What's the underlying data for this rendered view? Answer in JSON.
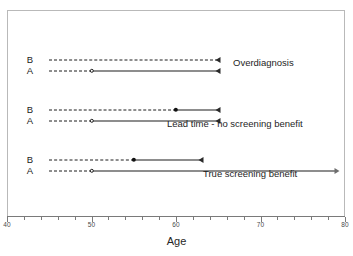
{
  "chart_data": {
    "type": "line",
    "title": "",
    "subtitle": "",
    "xlabel": "Age",
    "ylabel": "",
    "xlim": [
      40,
      80
    ],
    "grid": false,
    "legend": "none",
    "x_ticks_major": [
      40,
      50,
      60,
      70,
      80
    ],
    "x_tick_labels": [
      "40",
      "50",
      "60",
      "70",
      "80"
    ],
    "x_minor_tick_step": 2,
    "row_labels": [
      "B",
      "A"
    ],
    "scenarios": [
      {
        "name": "Overdiagnosis",
        "annotation": "Overdiagnosis",
        "rows": [
          {
            "label": "B",
            "dashed_from": 45,
            "dashed_to": 65,
            "solid_from": 65,
            "solid_to": 65,
            "start_marker": "none",
            "end_marker": "tri-left"
          },
          {
            "label": "A",
            "dashed_from": 45,
            "dashed_to": 50,
            "solid_from": 50,
            "solid_to": 65,
            "start_marker": "circle-open",
            "end_marker": "tri-left"
          }
        ]
      },
      {
        "name": "Lead time - no screening benefit",
        "annotation": "Lead time - no screening benefit",
        "rows": [
          {
            "label": "B",
            "dashed_from": 45,
            "dashed_to": 60,
            "solid_from": 60,
            "solid_to": 65,
            "start_marker": "circle-filled",
            "end_marker": "tri-left"
          },
          {
            "label": "A",
            "dashed_from": 45,
            "dashed_to": 50,
            "solid_from": 50,
            "solid_to": 65,
            "start_marker": "circle-open",
            "end_marker": "tri-left"
          }
        ]
      },
      {
        "name": "True screening benefit",
        "annotation": "True screening benefit",
        "rows": [
          {
            "label": "B",
            "dashed_from": 45,
            "dashed_to": 55,
            "solid_from": 55,
            "solid_to": 63,
            "start_marker": "circle-filled",
            "end_marker": "tri-left"
          },
          {
            "label": "A",
            "dashed_from": 45,
            "dashed_to": 50,
            "solid_from": 50,
            "solid_to": 79,
            "start_marker": "circle-open",
            "end_marker": "tri-open"
          }
        ]
      }
    ]
  },
  "axis": {
    "x_title": "Age"
  },
  "colors": {
    "line": "#1c1c1c",
    "frame": "#b9b9b9",
    "axis": "#7a7a7a",
    "text": "#1e1e1e",
    "background": "#ffffff"
  },
  "annotations": {
    "overdiagnosis": "Overdiagnosis",
    "lead_time": "Lead time - no screening benefit",
    "true_benefit": "True screening benefit"
  },
  "group_labels": {
    "b": "B",
    "a": "A"
  }
}
